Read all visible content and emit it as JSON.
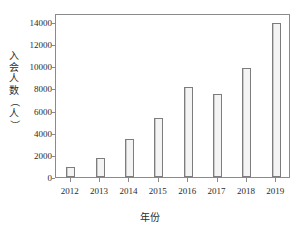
{
  "chart_data": {
    "type": "bar",
    "title": "",
    "xlabel": "年份",
    "ylabel": "入会人数（人）",
    "categories": [
      "2012",
      "2013",
      "2014",
      "2015",
      "2016",
      "2017",
      "2018",
      "2019"
    ],
    "values": [
      900,
      1700,
      3450,
      5350,
      8100,
      7450,
      9800,
      13900
    ],
    "series": [
      {
        "name": "入会人数",
        "values": [
          900,
          1700,
          3450,
          5350,
          8100,
          7450,
          9800,
          13900
        ]
      }
    ],
    "ylim": [
      0,
      14800
    ],
    "xlim_categories": 8,
    "y_ticks": [
      0,
      2000,
      4000,
      6000,
      8000,
      10000,
      12000,
      14000
    ],
    "y_tick_labels": [
      "0",
      "2000",
      "4000",
      "6000",
      "8000",
      "10000",
      "12000",
      "14000"
    ],
    "grid": false,
    "legend": false,
    "legend_position": "none",
    "bar_fill_color": "#f2f2f2",
    "bar_edge_color": "#7d7d7d",
    "axis_color": "#8a8a8a",
    "text_color": "#2b2b2b",
    "background_color": "#ffffff"
  },
  "axis_titles": {
    "y_chars": [
      "入",
      "会",
      "人",
      "数"
    ],
    "y_paren_open": "（",
    "y_char_last": "人",
    "y_paren_close": "）",
    "x": "年份"
  }
}
